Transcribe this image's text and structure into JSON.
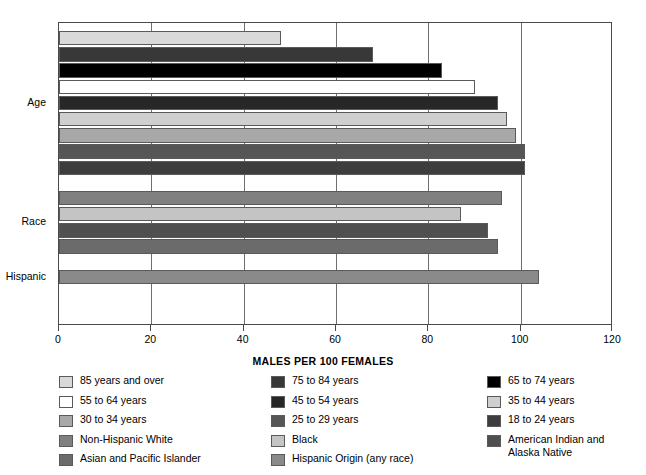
{
  "chart_data": {
    "type": "bar",
    "orientation": "horizontal",
    "title": "",
    "xlabel": "MALES PER 100 FEMALES",
    "ylabel": "",
    "xlim": [
      0,
      120
    ],
    "xticks": [
      0,
      20,
      40,
      60,
      80,
      100,
      120
    ],
    "grid": true,
    "legend_position": "bottom",
    "groups": [
      {
        "name": "Age",
        "label": "Age",
        "bars": [
          {
            "label": "85 years and over",
            "value": 48,
            "color": "#d9d9d9"
          },
          {
            "label": "75 to 84 years",
            "value": 68,
            "color": "#383838"
          },
          {
            "label": "65 to 74 years",
            "value": 83,
            "color": "#000000"
          },
          {
            "label": "55 to 64 years",
            "value": 90,
            "color": "#ffffff"
          },
          {
            "label": "45 to 54 years",
            "value": 95,
            "color": "#272727"
          },
          {
            "label": "35 to 44 years",
            "value": 97,
            "color": "#cfcfcf"
          },
          {
            "label": "30 to 34 years",
            "value": 99,
            "color": "#a8a8a8"
          },
          {
            "label": "25 to 29 years",
            "value": 101,
            "color": "#565656"
          },
          {
            "label": "18 to 24 years",
            "value": 101,
            "color": "#3d3d3d"
          }
        ]
      },
      {
        "name": "Race",
        "label": "Race",
        "bars": [
          {
            "label": "Non-Hispanic White",
            "value": 96,
            "color": "#808080"
          },
          {
            "label": "Black",
            "value": 87,
            "color": "#c4c4c4"
          },
          {
            "label": "American Indian and Alaska Native",
            "value": 93,
            "color": "#4f4f4f"
          },
          {
            "label": "Asian and Pacific Islander",
            "value": 95,
            "color": "#6b6b6b"
          }
        ]
      },
      {
        "name": "Hispanic",
        "label": "Hispanic",
        "bars": [
          {
            "label": "Hispanic Origin (any race)",
            "value": 104,
            "color": "#8a8a8a"
          }
        ]
      }
    ]
  },
  "axis": {
    "x_title": "MALES PER 100 FEMALES",
    "tick_labels": [
      "0",
      "20",
      "40",
      "60",
      "80",
      "100",
      "120"
    ]
  },
  "group_labels": [
    "Age",
    "Race",
    "Hispanic"
  ],
  "legend": {
    "columns": [
      [
        {
          "label": "85 years and over",
          "color": "#d9d9d9"
        },
        {
          "label": "55 to 64 years",
          "color": "#ffffff"
        },
        {
          "label": "30 to 34 years",
          "color": "#a8a8a8"
        },
        {
          "label": "Non-Hispanic White",
          "color": "#808080"
        },
        {
          "label": "Asian and Pacific Islander",
          "color": "#6b6b6b"
        }
      ],
      [
        {
          "label": "75 to 84 years",
          "color": "#383838"
        },
        {
          "label": "45 to 54 years",
          "color": "#272727"
        },
        {
          "label": "25 to 29 years",
          "color": "#565656"
        },
        {
          "label": "Black",
          "color": "#c4c4c4"
        },
        {
          "label": "Hispanic Origin (any race)",
          "color": "#8a8a8a"
        }
      ],
      [
        {
          "label": "65 to 74 years",
          "color": "#000000"
        },
        {
          "label": "35 to 44 years",
          "color": "#cfcfcf"
        },
        {
          "label": "18 to 24 years",
          "color": "#3d3d3d"
        },
        {
          "label": "American Indian and\nAlaska Native",
          "color": "#4f4f4f"
        }
      ]
    ]
  },
  "colors": {
    "frame": "#4a4a4a",
    "gridline": "#6e6e6e",
    "background": "#ffffff",
    "text": "#000000"
  }
}
